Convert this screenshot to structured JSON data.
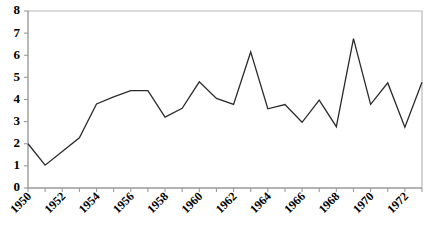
{
  "chart_data": {
    "type": "line",
    "title": "",
    "subtitle": "",
    "xlabel": "",
    "ylabel": "",
    "xlim": [
      1950,
      1973
    ],
    "ylim": [
      0,
      8
    ],
    "grid": false,
    "legend": false,
    "legend_position": "none",
    "y_ticks": [
      0,
      1,
      2,
      3,
      4,
      5,
      6,
      7,
      8
    ],
    "y_tick_labels": [
      "0",
      "1",
      "2",
      "3",
      "4",
      "5",
      "6",
      "7",
      "8"
    ],
    "x_tick_labels": [
      "1950",
      "1952",
      "1954",
      "1956",
      "1958",
      "1960",
      "1962",
      "1964",
      "1966",
      "1968",
      "1970",
      "1972"
    ],
    "x_tick_label_years": [
      1950,
      1952,
      1954,
      1956,
      1958,
      1960,
      1962,
      1964,
      1966,
      1968,
      1970,
      1972
    ],
    "x_minor_tick_years": [
      1950,
      1951,
      1952,
      1953,
      1954,
      1955,
      1956,
      1957,
      1958,
      1959,
      1960,
      1961,
      1962,
      1963,
      1964,
      1965,
      1966,
      1967,
      1968,
      1969,
      1970,
      1971,
      1972,
      1973
    ],
    "x_tick_label_rotation_deg": -45,
    "x": [
      1950,
      1951,
      1952,
      1953,
      1954,
      1955,
      1956,
      1957,
      1958,
      1959,
      1960,
      1961,
      1962,
      1963,
      1964,
      1965,
      1966,
      1967,
      1968,
      1969,
      1970,
      1971,
      1972,
      1973
    ],
    "values": [
      2.0,
      1.03,
      1.65,
      2.27,
      3.8,
      4.12,
      4.4,
      4.4,
      3.2,
      3.6,
      4.8,
      4.05,
      3.78,
      6.15,
      3.58,
      3.77,
      2.97,
      3.97,
      2.77,
      6.75,
      3.78,
      4.75,
      2.75,
      4.78
    ],
    "series": [
      {
        "name": "series-1",
        "color": "#2b2b2b",
        "values": [
          2.0,
          1.03,
          1.65,
          2.27,
          3.8,
          4.12,
          4.4,
          4.4,
          3.2,
          3.6,
          4.8,
          4.05,
          3.78,
          6.15,
          3.58,
          3.77,
          2.97,
          3.97,
          2.77,
          6.75,
          3.78,
          4.75,
          2.75,
          4.78
        ]
      }
    ],
    "annotations": []
  },
  "style": {
    "line_color": "#2b2b2b",
    "axis_color": "#9a9a9a",
    "border_color": "#b8b8b8",
    "text_color": "#000000",
    "background": "#ffffff"
  }
}
